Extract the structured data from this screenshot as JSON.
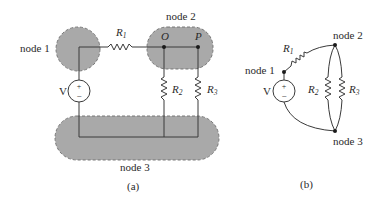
{
  "figure_a": {
    "caption": "(a)",
    "node_labels": {
      "node1": "node 1",
      "node2": "node 2",
      "node3": "node 3"
    },
    "point_labels": {
      "O": "O",
      "P": "P"
    },
    "source": {
      "label": "V",
      "plus": "+",
      "minus": "−"
    },
    "resistors": [
      {
        "name": "R",
        "sub": "1"
      },
      {
        "name": "R",
        "sub": "2"
      },
      {
        "name": "R",
        "sub": "3"
      }
    ]
  },
  "figure_b": {
    "caption": "(b)",
    "node_labels": {
      "node1": "node 1",
      "node2": "node 2",
      "node3": "node 3"
    },
    "source": {
      "label": "V",
      "plus": "+",
      "minus": "−"
    },
    "resistors": [
      {
        "name": "R",
        "sub": "1"
      },
      {
        "name": "R",
        "sub": "2"
      },
      {
        "name": "R",
        "sub": "3"
      }
    ]
  },
  "colors": {
    "node_fill": "#a9a9a9",
    "wire": "#3a3a3a",
    "text": "#2a2a2a"
  }
}
